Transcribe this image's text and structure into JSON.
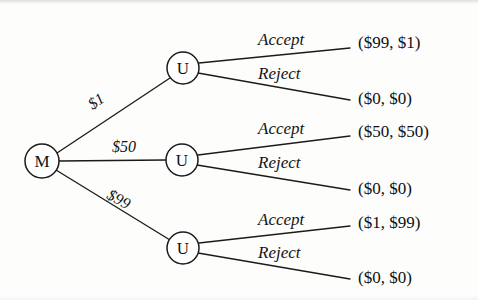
{
  "figure": {
    "kind": "game-tree",
    "background_color": "#fdfdfc",
    "ink_color": "#1b1b1b"
  },
  "nodes": {
    "root": {
      "label": "M",
      "name": "mover-node",
      "cx": 42,
      "cy": 161,
      "r": 17
    },
    "responders": [
      {
        "label": "U",
        "name": "responder-node-offer-1",
        "cx": 183,
        "cy": 68,
        "r": 16
      },
      {
        "label": "U",
        "name": "responder-node-offer-50",
        "cx": 182,
        "cy": 160,
        "r": 16
      },
      {
        "label": "U",
        "name": "responder-node-offer-99",
        "cx": 183,
        "cy": 248,
        "r": 16
      }
    ]
  },
  "branches": [
    {
      "offer_label": "$1",
      "offer_x": 96,
      "offer_y": 101,
      "offer_rotation": -34,
      "accept": {
        "action": "Accept",
        "action_x": 258,
        "action_y": 39,
        "payoff": "($99, $1)",
        "payoff_x": 358,
        "payoff_y": 42,
        "end_x": 350,
        "end_y": 48
      },
      "reject": {
        "action": "Reject",
        "action_x": 258,
        "action_y": 73,
        "payoff": "($0, $0)",
        "payoff_x": 358,
        "payoff_y": 98,
        "end_x": 350,
        "end_y": 100
      }
    },
    {
      "offer_label": "$50",
      "offer_x": 124,
      "offer_y": 146,
      "offer_rotation": 0,
      "accept": {
        "action": "Accept",
        "action_x": 258,
        "action_y": 128,
        "payoff": "($50, $50)",
        "payoff_x": 358,
        "payoff_y": 131,
        "end_x": 350,
        "end_y": 136
      },
      "reject": {
        "action": "Reject",
        "action_x": 258,
        "action_y": 162,
        "payoff": "($0, $0)",
        "payoff_x": 358,
        "payoff_y": 188,
        "end_x": 350,
        "end_y": 190
      }
    },
    {
      "offer_label": "$99",
      "offer_x": 119,
      "offer_y": 199,
      "offer_rotation": 29,
      "accept": {
        "action": "Accept",
        "action_x": 258,
        "action_y": 219,
        "payoff": "($1, $99)",
        "payoff_x": 358,
        "payoff_y": 222,
        "end_x": 350,
        "end_y": 226
      },
      "reject": {
        "action": "Reject",
        "action_x": 258,
        "action_y": 252,
        "payoff": "($0, $0)",
        "payoff_x": 358,
        "payoff_y": 277,
        "end_x": 350,
        "end_y": 279
      }
    }
  ]
}
